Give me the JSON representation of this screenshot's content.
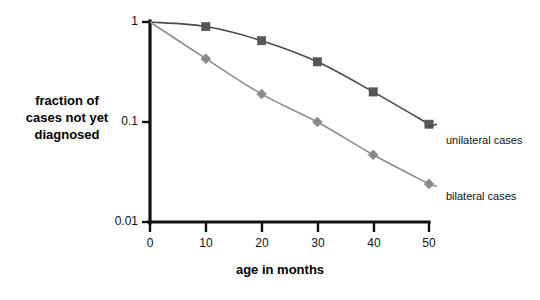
{
  "chart_data": {
    "type": "line",
    "title": "",
    "subtitle": "",
    "xlabel": "age in months",
    "ylabel": "fraction of cases not yet diagnosed",
    "x": [
      0,
      10,
      20,
      30,
      40,
      50
    ],
    "xtick_labels": [
      "0",
      "10",
      "20",
      "30",
      "40",
      "50"
    ],
    "ytick_labels": [
      "1",
      "0.1",
      "0.01"
    ],
    "ytick_values": [
      1,
      0.1,
      0.01
    ],
    "yscale": "log",
    "ylim": [
      0.01,
      1
    ],
    "xlim": [
      0,
      50
    ],
    "grid": false,
    "legend_position": "right-inline",
    "series": [
      {
        "name": "unilateral cases",
        "marker": "square",
        "color": "#565656",
        "line_color": "#4a4a4a",
        "values": [
          1.0,
          0.9,
          0.65,
          0.4,
          0.2,
          0.095
        ]
      },
      {
        "name": "bilateral cases",
        "marker": "diamond",
        "color": "#8a8a8a",
        "line_color": "#8c8c8c",
        "values": [
          1.0,
          0.43,
          0.19,
          0.1,
          0.047,
          0.024
        ]
      }
    ]
  },
  "labels": {
    "y_axis_title_line1": "fraction of",
    "y_axis_title_line2": "cases not yet",
    "y_axis_title_line3": "diagnosed",
    "x_axis_title": "age in months",
    "ytick_0": "1",
    "ytick_1": "0.1",
    "ytick_2": "0.01",
    "xtick_0": "0",
    "xtick_1": "10",
    "xtick_2": "20",
    "xtick_3": "30",
    "xtick_4": "40",
    "xtick_5": "50",
    "legend_unilateral": "unilateral cases",
    "legend_bilateral": "bilateral cases"
  }
}
